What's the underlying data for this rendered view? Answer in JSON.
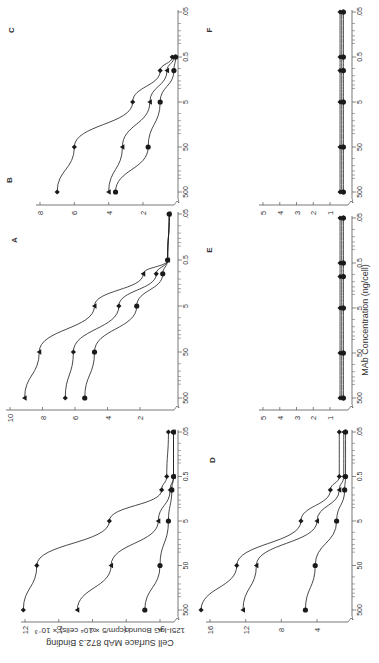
{
  "figure": {
    "ylabel_line1": "Cell Surface MAb 872.3 Binding",
    "ylabel_line2": "125I-IgG Bound (cpm/5 × 10⁴ cells) × 10⁻³",
    "xlabel": "MAb Concentration (ng/cell)",
    "ink": "#1a1a1a",
    "axis": "#555555"
  },
  "chart_data": [
    {
      "panel": "A",
      "type": "line",
      "title": "A",
      "xlabel": "MAb Concentration (ng/cell)",
      "ylabel": "Cell Surface MAb 872.3 Binding 125I-IgG Bound (cpm/5 × 10⁴ cells) × 10⁻³",
      "x": [
        500,
        50,
        5,
        1,
        0.5,
        0.05
      ],
      "x_ticks": [
        "500",
        "50",
        "5",
        "0.5",
        ".05"
      ],
      "y_ticks": [
        4,
        6,
        8,
        10,
        12
      ],
      "ylim": [
        3,
        12.5
      ],
      "series": [
        {
          "marker": "diamond",
          "values": [
            12.1,
            11.3,
            7.0,
            3.9,
            3.6,
            3.5
          ]
        },
        {
          "marker": "triangle",
          "values": [
            8.9,
            6.9,
            4.1,
            3.4,
            3.2,
            3.2
          ]
        },
        {
          "marker": "circle",
          "values": [
            4.9,
            4.0,
            3.5,
            3.3,
            3.2,
            3.2
          ]
        }
      ]
    },
    {
      "panel": "B",
      "type": "line",
      "title": "B",
      "x": [
        500,
        50,
        5,
        1,
        0.5,
        0.05
      ],
      "x_ticks": [
        "500",
        "50",
        "5",
        "0.5",
        ".05"
      ],
      "y_ticks": [
        2,
        4,
        6,
        8,
        10
      ],
      "ylim": [
        0,
        10
      ],
      "series": [
        {
          "marker": "triangle",
          "values": [
            9.1,
            8.2,
            4.8,
            1.8,
            0.3,
            0.2
          ]
        },
        {
          "marker": "diamond",
          "values": [
            6.6,
            6.1,
            3.3,
            1.0,
            0.3,
            0.2
          ]
        },
        {
          "marker": "circle",
          "values": [
            5.4,
            4.8,
            2.2,
            0.6,
            0.3,
            0.2
          ]
        }
      ]
    },
    {
      "panel": "C",
      "type": "line",
      "title": "C",
      "x": [
        500,
        50,
        5,
        1,
        0.5
      ],
      "x_ticks": [
        "500",
        "50",
        "5",
        "0.5",
        ".05"
      ],
      "y_ticks": [
        2,
        4,
        6,
        8
      ],
      "ylim": [
        0,
        8
      ],
      "series": [
        {
          "marker": "diamond",
          "values": [
            7.0,
            6.0,
            2.6,
            1.0,
            0.3
          ]
        },
        {
          "marker": "triangle",
          "values": [
            4.0,
            3.2,
            1.6,
            0.6,
            0.2
          ]
        },
        {
          "marker": "circle",
          "values": [
            3.6,
            1.7,
            1.0,
            0.2,
            0.1
          ]
        }
      ]
    },
    {
      "panel": "D",
      "type": "line",
      "title": "D",
      "x": [
        500,
        50,
        5,
        1,
        0.5,
        0.05
      ],
      "x_ticks": [
        "500",
        "50",
        "5",
        "0.5",
        ".05"
      ],
      "y_ticks": [
        4,
        8,
        12,
        16
      ],
      "ylim": [
        0,
        17
      ],
      "series": [
        {
          "marker": "diamond",
          "values": [
            17.0,
            13.0,
            5.8,
            2.5,
            1.5,
            1.5
          ]
        },
        {
          "marker": "triangle",
          "values": [
            12.3,
            10.8,
            4.0,
            1.5,
            1.0,
            1.0
          ]
        },
        {
          "marker": "circle",
          "values": [
            5.3,
            4.2,
            1.8,
            0.9,
            0.8,
            0.8
          ]
        }
      ]
    },
    {
      "panel": "E",
      "type": "line",
      "title": "E",
      "x": [
        500,
        50,
        5,
        1,
        0.5,
        0.05
      ],
      "x_ticks": [
        "500",
        "50",
        "5",
        "0.5",
        ".05"
      ],
      "y_ticks": [
        1,
        2,
        3,
        4,
        5
      ],
      "ylim": [
        0,
        5
      ],
      "series": [
        {
          "marker": "diamond",
          "values": [
            0.4,
            0.4,
            0.4,
            0.4,
            0.4,
            0.4
          ]
        },
        {
          "marker": "triangle",
          "values": [
            0.3,
            0.3,
            0.3,
            0.3,
            0.3,
            0.3
          ]
        },
        {
          "marker": "circle",
          "values": [
            0.2,
            0.2,
            0.2,
            0.2,
            0.2,
            0.2
          ]
        }
      ]
    },
    {
      "panel": "F",
      "type": "line",
      "title": "F",
      "x": [
        500,
        50,
        5,
        1,
        0.5,
        0.05
      ],
      "x_ticks": [
        "500",
        "50",
        "5",
        "0.5",
        ".05"
      ],
      "y_ticks": [
        1,
        2,
        3,
        4,
        5
      ],
      "ylim": [
        0,
        5
      ],
      "series": [
        {
          "marker": "diamond",
          "values": [
            0.4,
            0.4,
            0.4,
            0.4,
            0.4,
            0.4
          ]
        },
        {
          "marker": "triangle",
          "values": [
            0.3,
            0.3,
            0.3,
            0.3,
            0.3,
            0.3
          ]
        },
        {
          "marker": "circle",
          "values": [
            0.2,
            0.2,
            0.2,
            0.2,
            0.2,
            0.2
          ]
        }
      ]
    }
  ],
  "layout": {
    "panels": {
      "A": {
        "axisX": 178,
        "yTop": 432,
        "yBottom": 610,
        "valLeft": 25,
        "valueAtLeft": 12,
        "valRight": 160,
        "valueAtRight": 4,
        "tickRow": 622,
        "letter": [
          15,
          240
        ]
      },
      "B": {
        "axisX": 178,
        "yTop": 214,
        "yBottom": 398,
        "valLeft": 10,
        "valueAtLeft": 10,
        "valRight": 140,
        "valueAtRight": 2,
        "tickRow": 410,
        "letter": [
          10,
          180
        ]
      },
      "C": {
        "axisX": 178,
        "yTop": 12,
        "yBottom": 192,
        "valLeft": 40,
        "valueAtLeft": 8,
        "valRight": 143,
        "valueAtRight": 2,
        "tickRow": 205,
        "letter": [
          12,
          30
        ]
      },
      "D": {
        "axisX": 352,
        "yTop": 432,
        "yBottom": 610,
        "valLeft": 210,
        "valueAtLeft": 16,
        "valRight": 317,
        "valueAtRight": 4,
        "tickRow": 622,
        "letter": [
          213,
          460
        ]
      },
      "E": {
        "axisX": 352,
        "yTop": 218,
        "yBottom": 398,
        "valLeft": 263,
        "valueAtLeft": 5,
        "valRight": 330,
        "valueAtRight": 1,
        "tickRow": 410,
        "letter": [
          210,
          250
        ]
      },
      "F": {
        "axisX": 352,
        "yTop": 12,
        "yBottom": 192,
        "valLeft": 263,
        "valueAtLeft": 5,
        "valRight": 330,
        "valueAtRight": 1,
        "tickRow": 205,
        "letter": [
          210,
          30
        ]
      }
    }
  }
}
